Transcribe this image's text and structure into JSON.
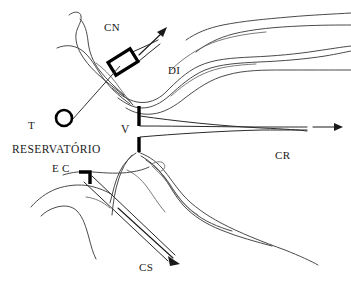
{
  "figure": {
    "type": "hand-drawn hydraulic engineering schematic",
    "background_color": "#ffffff",
    "line_color": "#4a4a4a",
    "ink_color": "#000000",
    "width": 351,
    "height": 284
  },
  "labels": {
    "diversion_channel": "CN",
    "intake_structure": "DI",
    "tower": "T",
    "reservoir": "RESERVATÓRIO",
    "bottom_outlet": "E C",
    "spillway": "V",
    "restitution_channel": "CR",
    "discharge_channel": "CS"
  },
  "label_positions": {
    "CN": {
      "x": 104,
      "y": 22
    },
    "DI": {
      "x": 168,
      "y": 65
    },
    "T": {
      "x": 28,
      "y": 120
    },
    "RESERVATORIO": {
      "x": 12,
      "y": 144
    },
    "EC": {
      "x": 52,
      "y": 163
    },
    "V": {
      "x": 121,
      "y": 124
    },
    "CR": {
      "x": 275,
      "y": 150
    },
    "CS": {
      "x": 139,
      "y": 262
    }
  },
  "components": {
    "tower_symbol": "circle",
    "diversion_gate_symbol": "rotated-rectangle",
    "outlet_gate_symbol": "bracket",
    "dam_symbol": "vertical-thick-line",
    "flow_arrows": 3
  }
}
